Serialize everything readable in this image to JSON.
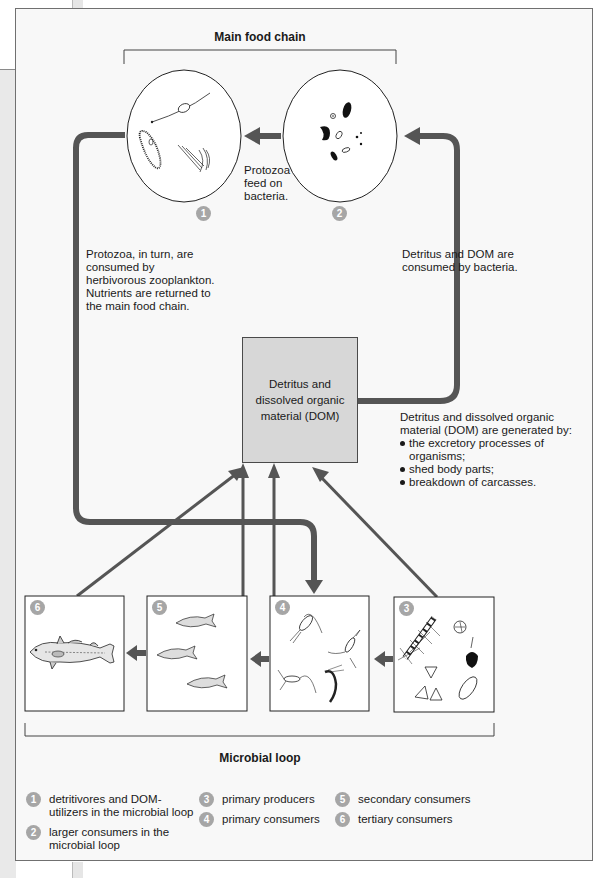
{
  "figure": {
    "main_food_chain_label": "Main food chain",
    "microbial_loop_label": "Microbial loop",
    "dom_box_label": "Detritus and dissolved organic material (DOM)",
    "annotations": {
      "protozoa_feed": "Protozoa feed on bacteria.",
      "protozoa_consumed": "Protozoa, in turn, are consumed by herbivorous zooplankton. Nutrients are returned to the main food chain.",
      "dom_consumed": "Detritus and DOM are consumed by bacteria.",
      "dom_generated_intro": "Detritus and dissolved organic material (DOM) are generated by:",
      "dom_generated_items": [
        "the excretory processes of organisms;",
        "shed body parts;",
        "breakdown of carcasses."
      ]
    },
    "nodes": [
      {
        "id": 1,
        "badge": "1",
        "shape": "circle",
        "depicts": "protozoa (flagellate, ciliate, choanoflagellate)"
      },
      {
        "id": 2,
        "badge": "2",
        "shape": "circle",
        "depicts": "bacteria"
      },
      {
        "id": 3,
        "badge": "3",
        "shape": "box",
        "depicts": "phytoplankton (diatoms, dinoflagellates)"
      },
      {
        "id": 4,
        "badge": "4",
        "shape": "box",
        "depicts": "zooplankton (copepods, shrimp)"
      },
      {
        "id": 5,
        "badge": "5",
        "shape": "box",
        "depicts": "small fish"
      },
      {
        "id": 6,
        "badge": "6",
        "shape": "box",
        "depicts": "large fish"
      }
    ],
    "colors": {
      "arrow": "#555555",
      "badge": "#a6a6a6",
      "dom_box": "#d7d7d7",
      "frame_bg": "#f8f8f8"
    }
  },
  "legend": {
    "items": [
      {
        "badge": "1",
        "text": "detritivores and DOM-utilizers in the microbial loop"
      },
      {
        "badge": "2",
        "text": "larger consumers in the microbial loop"
      },
      {
        "badge": "3",
        "text": "primary producers"
      },
      {
        "badge": "4",
        "text": "primary consumers"
      },
      {
        "badge": "5",
        "text": "secondary consumers"
      },
      {
        "badge": "6",
        "text": "tertiary consumers"
      }
    ]
  }
}
